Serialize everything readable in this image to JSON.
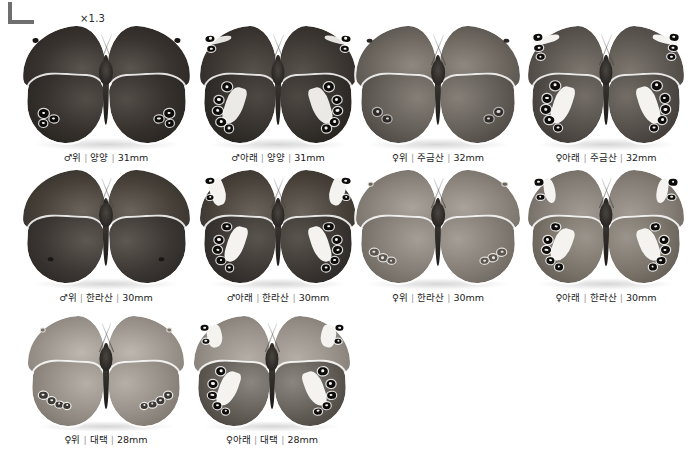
{
  "plate": {
    "background_color": "#ffffff",
    "corner_mark": "crop-corner-mark",
    "scale_label": "×1.3"
  },
  "specimens": [
    {
      "id": "r1c1",
      "sex": "♂",
      "side": "위",
      "locality": "양양",
      "size": "31mm",
      "view": "upperside",
      "tone": "dark",
      "caption": "♂위 | 양양 | 31mm"
    },
    {
      "id": "r1c2",
      "sex": "♂",
      "side": "아래",
      "locality": "양양",
      "size": "31mm",
      "view": "underside",
      "tone": "dark",
      "caption": "♂아래 | 양양 | 31mm"
    },
    {
      "id": "r1c3",
      "sex": "♀",
      "side": "위",
      "locality": "주금산",
      "size": "32mm",
      "view": "upperside",
      "tone": "mid",
      "caption": "♀위 | 주금산 | 32mm"
    },
    {
      "id": "r1c4",
      "sex": "♀",
      "side": "아래",
      "locality": "주금산",
      "size": "32mm",
      "view": "underside",
      "tone": "mid",
      "caption": "♀아래 | 주금산 | 32mm"
    },
    {
      "id": "r2c1",
      "sex": "♂",
      "side": "위",
      "locality": "한라산",
      "size": "30mm",
      "view": "upperside",
      "tone": "dark",
      "caption": "♂위 | 한라산 | 30mm"
    },
    {
      "id": "r2c2",
      "sex": "♂",
      "side": "아래",
      "locality": "한라산",
      "size": "30mm",
      "view": "underside",
      "tone": "dark",
      "caption": "♂아래 | 한라산 | 30mm"
    },
    {
      "id": "r2c3",
      "sex": "♀",
      "side": "위",
      "locality": "한라산",
      "size": "30mm",
      "view": "upperside",
      "tone": "light",
      "caption": "♀위 | 한라산 | 30mm"
    },
    {
      "id": "r2c4",
      "sex": "♀",
      "side": "아래",
      "locality": "한라산",
      "size": "30mm",
      "view": "underside",
      "tone": "light",
      "caption": "♀아래 | 한라산 | 30mm"
    },
    {
      "id": "r3c1",
      "sex": "♀",
      "side": "위",
      "locality": "대택",
      "size": "28mm",
      "view": "upperside",
      "tone": "light",
      "caption": "♀위 | 대택 | 28mm"
    },
    {
      "id": "r3c2",
      "sex": "♀",
      "side": "아래",
      "locality": "대택",
      "size": "28mm",
      "view": "underside",
      "tone": "light",
      "caption": "♀아래 | 대택 | 28mm"
    }
  ]
}
